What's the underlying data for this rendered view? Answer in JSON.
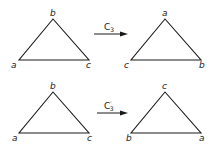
{
  "diagram": {
    "title": "",
    "rows": [
      {
        "operation": {
          "symbol": "C",
          "prime": "",
          "subscript": "3"
        },
        "before": {
          "top": "b",
          "left": "a",
          "right": "c"
        },
        "after": {
          "top": "a",
          "left": "c",
          "right": "b"
        }
      },
      {
        "operation": {
          "symbol": "C",
          "prime": "′",
          "subscript": "3"
        },
        "before": {
          "top": "b",
          "left": "a",
          "right": "c"
        },
        "after": {
          "top": "c",
          "left": "b",
          "right": "a"
        }
      }
    ],
    "colors": {
      "stroke": "#1a1a1a",
      "background": "#ffffff"
    }
  }
}
